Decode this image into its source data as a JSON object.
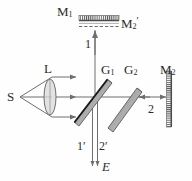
{
  "figure": {
    "type": "optics-ray-diagram",
    "name": "Michelson interferometer",
    "stroke_color": "#6e6e6e",
    "label_color": "#2b2b2b",
    "plate_fill": "#b8b8b8",
    "plate_edge": "#555555",
    "coating_color": "#1a1a1a"
  },
  "labels": {
    "mirror1": {
      "base": "M",
      "sub": "1",
      "prime": ""
    },
    "mirror2_virtual": {
      "base": "M",
      "sub": "2",
      "prime": "′"
    },
    "mirror2": {
      "base": "M",
      "sub": "2",
      "prime": ""
    },
    "lens": {
      "base": "L",
      "sub": "",
      "prime": ""
    },
    "source": {
      "base": "S",
      "sub": "",
      "prime": ""
    },
    "splitter1": {
      "base": "G",
      "sub": "1",
      "prime": ""
    },
    "compensator": {
      "base": "G",
      "sub": "2",
      "prime": ""
    },
    "beam1": "1",
    "beam2": "2",
    "beam1_prime": "1′",
    "beam2_prime": "2′",
    "eye": "E"
  },
  "components": {
    "source_label": "S",
    "lens_label": "L",
    "beamsplitter_label": "G1",
    "compensator_label": "G2",
    "top_mirror_label": "M1",
    "virtual_mirror_label": "M2'",
    "right_mirror_label": "M2",
    "output_label": "E"
  }
}
